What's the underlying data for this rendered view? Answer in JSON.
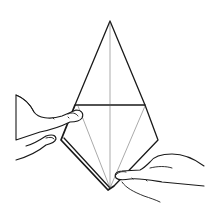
{
  "illustration": {
    "subject": "origami-kite-fold-with-hands",
    "line_color": "#1a1a1a",
    "background": "#ffffff",
    "caption": ""
  }
}
